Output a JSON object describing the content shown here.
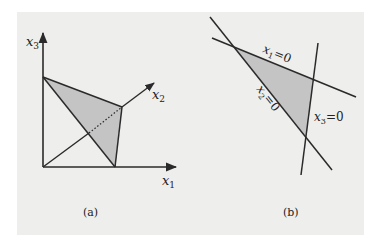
{
  "figure": {
    "panel_color": "#eeeeec",
    "shade_color": "#c4c4c4",
    "line_color": "#2a2a2a",
    "a": {
      "caption": "(a)",
      "axes": {
        "x1": {
          "base": "x",
          "sub": "1"
        },
        "x2": {
          "base": "x",
          "sub": "2"
        },
        "x3": {
          "base": "x",
          "sub": "3"
        }
      },
      "description": "Shaded triangle in 3D positive orthant with vertices on the x1, x2, x3 axes"
    },
    "b": {
      "caption": "(b)",
      "lines": [
        {
          "label_base": "x",
          "sub": "1",
          "eq": "=0"
        },
        {
          "label_base": "x",
          "sub": "2",
          "eq": "=0"
        },
        {
          "label_base": "x",
          "sub": "3",
          "eq": "=0"
        }
      ],
      "description": "Shaded triangle bounded by three lines x1=0, x2=0, x3=0"
    }
  }
}
